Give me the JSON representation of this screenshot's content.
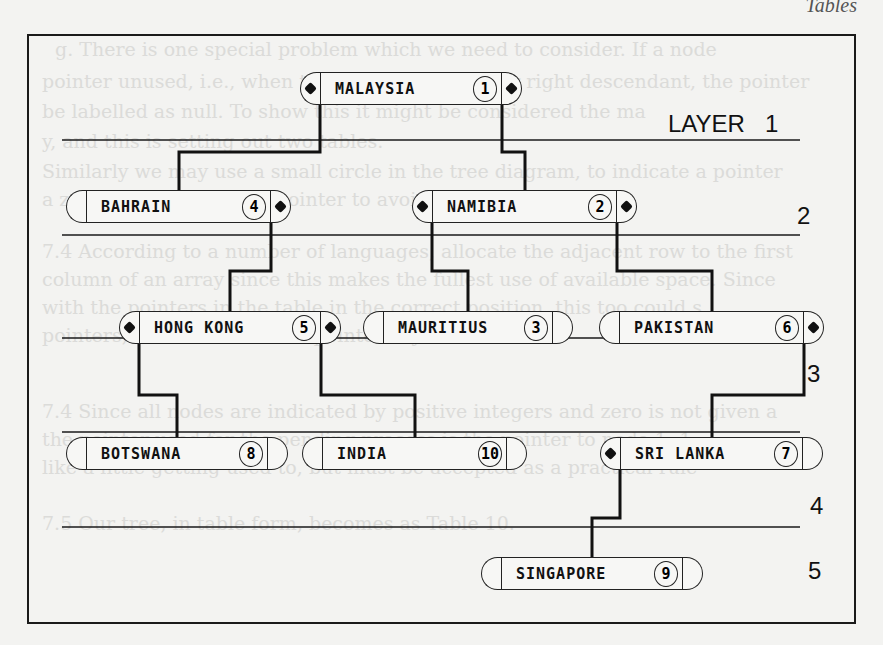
{
  "page_header": "Tables",
  "layers": [
    {
      "label": "LAYER   1",
      "x": 668,
      "y": 110
    },
    {
      "label": "2",
      "x": 797,
      "y": 202
    },
    {
      "label": "3",
      "x": 807,
      "y": 360
    },
    {
      "label": "4",
      "x": 810,
      "y": 492
    },
    {
      "label": "5",
      "x": 808,
      "y": 557
    }
  ],
  "separator_y": [
    140,
    235,
    338,
    432,
    527
  ],
  "nodes": [
    {
      "id": 1,
      "name": "MALAYSIA",
      "number": "1",
      "x": 300,
      "y": 72,
      "w": 222,
      "left_ptr": true,
      "right_ptr": true
    },
    {
      "id": 2,
      "name": "NAMIBIA",
      "number": "2",
      "x": 412,
      "y": 190,
      "w": 225,
      "left_ptr": true,
      "right_ptr": true
    },
    {
      "id": 3,
      "name": "MAURITIUS",
      "number": "3",
      "x": 363,
      "y": 311,
      "w": 210,
      "left_ptr": false,
      "right_ptr": false
    },
    {
      "id": 4,
      "name": "BAHRAIN",
      "number": "4",
      "x": 66,
      "y": 190,
      "w": 225,
      "left_ptr": false,
      "right_ptr": true
    },
    {
      "id": 5,
      "name": "HONG KONG",
      "number": "5",
      "x": 119,
      "y": 311,
      "w": 222,
      "left_ptr": true,
      "right_ptr": true
    },
    {
      "id": 6,
      "name": "PAKISTAN",
      "number": "6",
      "x": 599,
      "y": 311,
      "w": 225,
      "left_ptr": false,
      "right_ptr": true
    },
    {
      "id": 7,
      "name": "SRI LANKA",
      "number": "7",
      "x": 600,
      "y": 437,
      "w": 223,
      "left_ptr": true,
      "right_ptr": false
    },
    {
      "id": 8,
      "name": "BOTSWANA",
      "number": "8",
      "x": 66,
      "y": 437,
      "w": 222,
      "left_ptr": false,
      "right_ptr": false
    },
    {
      "id": 9,
      "name": "SINGAPORE",
      "number": "9",
      "x": 481,
      "y": 557,
      "w": 222,
      "left_ptr": false,
      "right_ptr": false
    },
    {
      "id": 10,
      "name": "INDIA",
      "number": "10",
      "x": 302,
      "y": 437,
      "w": 225,
      "left_ptr": false,
      "right_ptr": false
    }
  ],
  "links": [
    {
      "from": 1,
      "to": 4,
      "side": "left"
    },
    {
      "from": 1,
      "to": 2,
      "side": "right"
    },
    {
      "from": 4,
      "to": 5,
      "side": "right"
    },
    {
      "from": 2,
      "to": 3,
      "side": "left"
    },
    {
      "from": 2,
      "to": 6,
      "side": "right"
    },
    {
      "from": 5,
      "to": 8,
      "side": "left"
    },
    {
      "from": 5,
      "to": 10,
      "side": "right"
    },
    {
      "from": 6,
      "to": 7,
      "side": "right"
    },
    {
      "from": 7,
      "to": 9,
      "side": "left"
    }
  ],
  "background_text": [
    {
      "text": "g. There is one special problem which we need to consider. If a node",
      "x": 55,
      "y": 38
    },
    {
      "text": "pointer unused, i.e., when there is no left child or right descendant, the pointer",
      "x": 42,
      "y": 70
    },
    {
      "text": "be labelled as null. To show this it might be considered the ma",
      "x": 42,
      "y": 100
    },
    {
      "text": "y, and this is setting out two tables.",
      "x": 42,
      "y": 130
    },
    {
      "text": "Similarly we may use a small circle in the tree diagram, to indicate a pointer",
      "x": 42,
      "y": 160
    },
    {
      "text": "a zero to indicate a null pointer to avoid confusion.",
      "x": 42,
      "y": 188
    },
    {
      "text": "7.4  According to a number of languages, allocate the adjacent row to the first",
      "x": 42,
      "y": 240
    },
    {
      "text": "column of an array since this makes the fullest use of available space. Since",
      "x": 42,
      "y": 268
    },
    {
      "text": "with the pointers in the table in the correct position, this too could s",
      "x": 42,
      "y": 296
    },
    {
      "text": "pointers, and indicated null pointers by zeros.",
      "x": 42,
      "y": 324
    },
    {
      "text": "7.4  Since all nodes are indicated by positive integers and zero is not given a",
      "x": 42,
      "y": 400
    },
    {
      "text": "the pointer used for the pending process is the pointer to node 1 -1",
      "x": 42,
      "y": 428
    },
    {
      "text": "like a little getting used to, but must be accepted as a practical rule",
      "x": 42,
      "y": 456
    },
    {
      "text": "7.5  Our tree, in table form, becomes as Table 10.",
      "x": 42,
      "y": 512
    }
  ]
}
